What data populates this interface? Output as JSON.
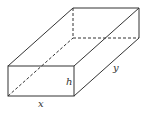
{
  "diagram": {
    "type": "rectangular-box",
    "labels": {
      "x": "x",
      "y": "y",
      "h": "h"
    },
    "colors": {
      "stroke": "#333333",
      "background": "#ffffff"
    }
  }
}
